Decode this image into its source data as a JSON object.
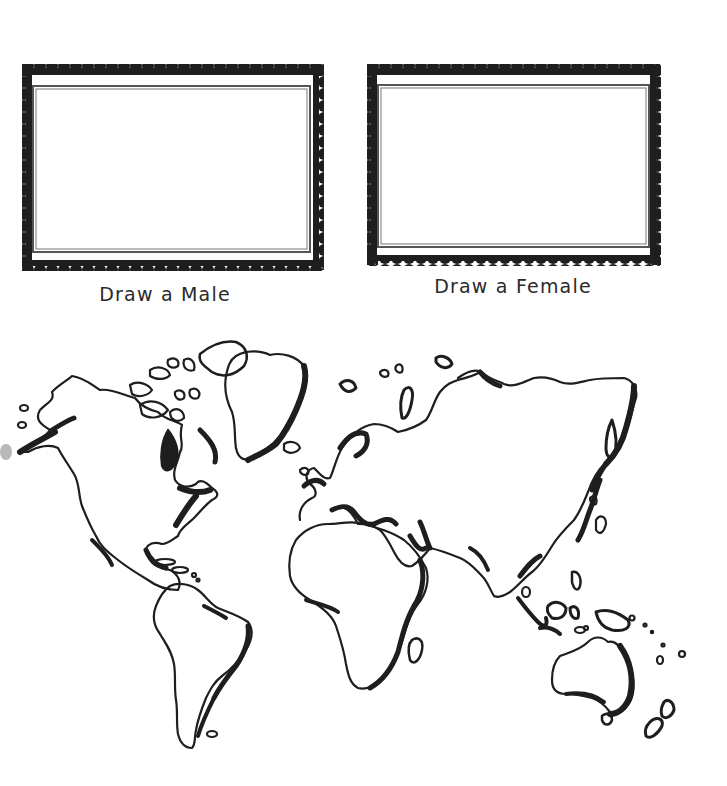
{
  "worksheet": {
    "frames": [
      {
        "id": "male",
        "label": "Draw a Male",
        "outer": {
          "x": 22,
          "y": 65,
          "w": 300,
          "h": 205
        },
        "inner": {
          "x": 32,
          "y": 86,
          "w": 279,
          "h": 167
        },
        "label_pos": {
          "cx": 165,
          "y": 283
        }
      },
      {
        "id": "female",
        "label": "Draw a Female",
        "outer": {
          "x": 367,
          "y": 65,
          "w": 293,
          "h": 200
        },
        "inner": {
          "x": 377,
          "y": 84,
          "w": 273,
          "h": 163
        },
        "label_pos": {
          "cx": 513,
          "y": 275
        }
      }
    ],
    "map": {
      "title": "",
      "type": "outline world map",
      "continents": [
        "North America",
        "Greenland",
        "South America",
        "Europe",
        "Africa",
        "Asia",
        "Australia",
        "New Zealand"
      ]
    },
    "colors": {
      "ink": "#1e1e1e",
      "frame_inner_line": "#555555",
      "background": "#ffffff",
      "text": "#2a2a2a"
    }
  }
}
